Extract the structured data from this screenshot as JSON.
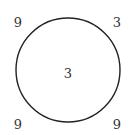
{
  "diagram": {
    "type": "number-puzzle-circle",
    "circle": {
      "cx": 68,
      "cy": 70,
      "r": 52,
      "stroke": "#222222",
      "stroke_width": 1.4
    },
    "corners": {
      "top_left": "9",
      "top_right": "3",
      "bottom_left": "9",
      "bottom_right": "9"
    },
    "center": "3"
  }
}
